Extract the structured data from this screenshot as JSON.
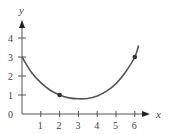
{
  "chart_data": {
    "type": "line",
    "title": "",
    "xlabel": "x",
    "ylabel": "y",
    "x_ticks": [
      "1",
      "2",
      "3",
      "4",
      "5",
      "6"
    ],
    "y_ticks": [
      "1",
      "2",
      "3",
      "4"
    ],
    "origin_label": "0",
    "xlim": [
      0,
      7
    ],
    "ylim": [
      0,
      5
    ],
    "grid": false,
    "legend": "none",
    "series": [
      {
        "name": "curve",
        "x": [
          0,
          0.5,
          1,
          1.5,
          2,
          2.5,
          3,
          3.5,
          4,
          4.5,
          5,
          5.5,
          6,
          6.2
        ],
        "y": [
          3,
          2.2,
          1.65,
          1.25,
          1.0,
          0.85,
          0.8,
          0.82,
          0.95,
          1.2,
          1.6,
          2.2,
          3.0,
          3.6
        ]
      }
    ],
    "marked_points": [
      {
        "x": 2,
        "y": 1
      },
      {
        "x": 6,
        "y": 3
      }
    ],
    "colors": {
      "curve": "#555555",
      "axes": "#555555"
    }
  }
}
